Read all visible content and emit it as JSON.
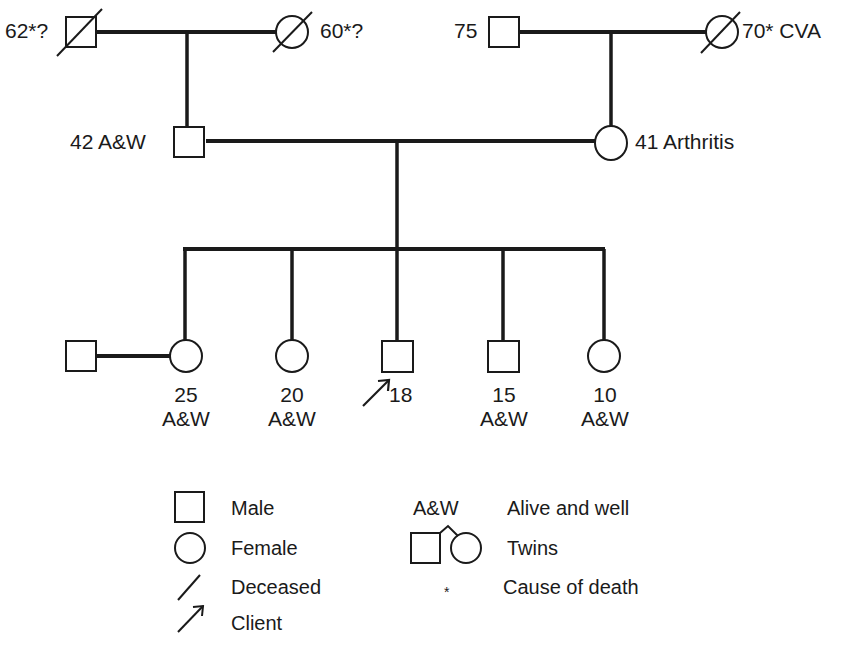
{
  "pedigree": {
    "generation1": {
      "paternal_grandfather": {
        "label": "62*?",
        "sex": "male",
        "status": "deceased"
      },
      "paternal_grandmother": {
        "label": "60*?",
        "sex": "female",
        "status": "deceased"
      },
      "maternal_grandfather": {
        "label": "75",
        "sex": "male",
        "status": "alive"
      },
      "maternal_grandmother": {
        "label": "70* CVA",
        "sex": "female",
        "status": "deceased"
      }
    },
    "generation2": {
      "father": {
        "label": "42 A&W",
        "sex": "male"
      },
      "mother": {
        "label": "41 Arthritis",
        "sex": "female"
      }
    },
    "generation3": {
      "spouse": {
        "sex": "male",
        "label": ""
      },
      "children": [
        {
          "age": "25",
          "note": "A&W",
          "sex": "female"
        },
        {
          "age": "20",
          "note": "A&W",
          "sex": "female"
        },
        {
          "age": "18",
          "note": "",
          "sex": "male",
          "client": true
        },
        {
          "age": "15",
          "note": "A&W",
          "sex": "male"
        },
        {
          "age": "10",
          "note": "A&W",
          "sex": "female"
        }
      ]
    }
  },
  "legend": {
    "male": "Male",
    "female": "Female",
    "deceased": "Deceased",
    "client": "Client",
    "aw_symbol": "A&W",
    "aw_meaning": "Alive and well",
    "twins": "Twins",
    "asterisk_symbol": "*",
    "asterisk_meaning": "Cause of death"
  }
}
